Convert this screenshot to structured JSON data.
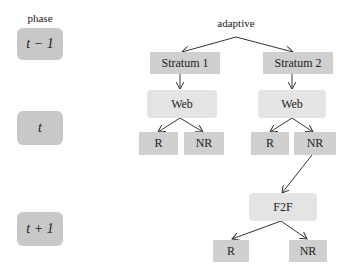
{
  "diagram": {
    "phase_header": "phase",
    "phases": [
      {
        "label": "t − 1"
      },
      {
        "label": "t"
      },
      {
        "label": "t + 1"
      }
    ],
    "root": {
      "label": "adaptive"
    },
    "strata": [
      {
        "label": "Stratum 1"
      },
      {
        "label": "Stratum 2"
      }
    ],
    "web_nodes": [
      {
        "label": "Web"
      },
      {
        "label": "Web"
      }
    ],
    "t_outcomes": [
      {
        "label": "R"
      },
      {
        "label": "NR"
      },
      {
        "label": "R"
      },
      {
        "label": "NR"
      }
    ],
    "f2f_node": {
      "label": "F2F"
    },
    "t1_outcomes": [
      {
        "label": "R"
      },
      {
        "label": "NR"
      }
    ],
    "colors": {
      "phase_box": "#c8c8c8",
      "stratum_box": "#cfcfcf",
      "web_box": "#e4e4e4",
      "leaf_box": "#cfcfcf",
      "arrow": "#333333"
    }
  }
}
